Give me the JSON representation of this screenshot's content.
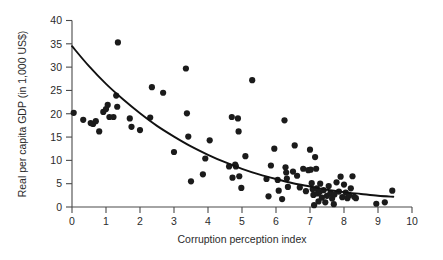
{
  "chart_data": {
    "type": "scatter",
    "title": "",
    "xlabel": "Corruption perception index",
    "ylabel": "Real per capita GDP (in 1,000 US$)",
    "xlim": [
      0,
      10
    ],
    "ylim": [
      0,
      40
    ],
    "xticks": [
      0,
      1,
      2,
      3,
      4,
      5,
      6,
      7,
      8,
      9,
      10
    ],
    "yticks": [
      0,
      5,
      10,
      15,
      20,
      25,
      30,
      35,
      40
    ],
    "xticklabels": [
      "0",
      "1",
      "2",
      "3",
      "4",
      "5",
      "6",
      "7",
      "8",
      "9",
      "10"
    ],
    "yticklabels": [
      "0",
      "5",
      "10",
      "15",
      "20",
      "25",
      "30",
      "35",
      "40"
    ],
    "grid": false,
    "legend": null,
    "marker": {
      "shape": "circle",
      "color": "#1b1b1b",
      "size_px": 4.0
    },
    "points": [
      [
        0.05,
        20.2
      ],
      [
        0.33,
        18.7
      ],
      [
        0.55,
        18.0
      ],
      [
        0.62,
        17.8
      ],
      [
        0.7,
        18.4
      ],
      [
        0.8,
        16.2
      ],
      [
        0.92,
        20.4
      ],
      [
        1.0,
        21.0
      ],
      [
        1.05,
        21.9
      ],
      [
        1.1,
        19.3
      ],
      [
        1.22,
        19.3
      ],
      [
        1.3,
        23.9
      ],
      [
        1.33,
        21.5
      ],
      [
        1.35,
        35.3
      ],
      [
        1.7,
        19.0
      ],
      [
        1.75,
        17.2
      ],
      [
        2.0,
        16.5
      ],
      [
        2.3,
        19.2
      ],
      [
        2.35,
        25.7
      ],
      [
        2.68,
        24.5
      ],
      [
        3.0,
        11.8
      ],
      [
        3.35,
        29.7
      ],
      [
        3.38,
        20.1
      ],
      [
        3.42,
        15.1
      ],
      [
        3.5,
        5.5
      ],
      [
        3.85,
        7.0
      ],
      [
        3.92,
        10.4
      ],
      [
        4.05,
        14.3
      ],
      [
        4.62,
        8.7
      ],
      [
        4.7,
        19.3
      ],
      [
        4.72,
        6.3
      ],
      [
        4.8,
        9.1
      ],
      [
        4.82,
        8.7
      ],
      [
        4.88,
        19.0
      ],
      [
        4.9,
        16.2
      ],
      [
        4.92,
        6.6
      ],
      [
        4.98,
        4.1
      ],
      [
        5.1,
        10.9
      ],
      [
        5.3,
        27.2
      ],
      [
        5.72,
        6.0
      ],
      [
        5.78,
        2.3
      ],
      [
        5.85,
        8.9
      ],
      [
        5.95,
        12.5
      ],
      [
        6.05,
        5.8
      ],
      [
        6.08,
        3.5
      ],
      [
        6.18,
        1.7
      ],
      [
        6.25,
        18.6
      ],
      [
        6.28,
        8.5
      ],
      [
        6.3,
        7.4
      ],
      [
        6.32,
        6.1
      ],
      [
        6.35,
        4.3
      ],
      [
        6.5,
        7.6
      ],
      [
        6.55,
        13.2
      ],
      [
        6.62,
        6.7
      ],
      [
        6.7,
        4.2
      ],
      [
        6.8,
        8.2
      ],
      [
        6.88,
        3.4
      ],
      [
        6.95,
        7.9
      ],
      [
        7.0,
        12.3
      ],
      [
        7.02,
        8.0
      ],
      [
        7.05,
        5.1
      ],
      [
        7.08,
        3.8
      ],
      [
        7.1,
        2.6
      ],
      [
        7.12,
        0.4
      ],
      [
        7.15,
        10.7
      ],
      [
        7.18,
        8.2
      ],
      [
        7.2,
        4.0
      ],
      [
        7.22,
        2.9
      ],
      [
        7.25,
        1.2
      ],
      [
        7.28,
        3.2
      ],
      [
        7.3,
        5.0
      ],
      [
        7.35,
        2.0
      ],
      [
        7.4,
        3.6
      ],
      [
        7.45,
        1.0
      ],
      [
        7.5,
        2.4
      ],
      [
        7.55,
        4.5
      ],
      [
        7.6,
        3.0
      ],
      [
        7.65,
        1.8
      ],
      [
        7.7,
        0.6
      ],
      [
        7.72,
        2.7
      ],
      [
        7.78,
        5.3
      ],
      [
        7.85,
        3.3
      ],
      [
        7.9,
        6.5
      ],
      [
        7.95,
        2.1
      ],
      [
        8.0,
        4.8
      ],
      [
        8.05,
        3.1
      ],
      [
        8.1,
        1.9
      ],
      [
        8.15,
        2.5
      ],
      [
        8.2,
        4.0
      ],
      [
        8.25,
        6.6
      ],
      [
        8.3,
        2.2
      ],
      [
        8.35,
        1.9
      ],
      [
        8.95,
        0.7
      ],
      [
        9.2,
        1.0
      ],
      [
        9.42,
        3.5
      ]
    ],
    "fit_curve": {
      "label": "exponential trend",
      "color": "#111111",
      "x_start": 0.0,
      "x_end": 9.45,
      "y_start": 34.5,
      "y_end": 2.2,
      "samples": [
        [
          0.0,
          34.5
        ],
        [
          0.5,
          30.2
        ],
        [
          1.0,
          26.4
        ],
        [
          1.5,
          23.1
        ],
        [
          2.0,
          20.1
        ],
        [
          2.5,
          17.4
        ],
        [
          3.0,
          15.1
        ],
        [
          3.5,
          13.0
        ],
        [
          4.0,
          11.2
        ],
        [
          4.5,
          9.6
        ],
        [
          5.0,
          8.2
        ],
        [
          5.5,
          7.0
        ],
        [
          6.0,
          6.0
        ],
        [
          6.5,
          5.1
        ],
        [
          7.0,
          4.4
        ],
        [
          7.5,
          3.7
        ],
        [
          8.0,
          3.2
        ],
        [
          8.5,
          2.8
        ],
        [
          9.0,
          2.4
        ],
        [
          9.45,
          2.2
        ]
      ]
    }
  },
  "axes": {
    "x_title": "Corruption perception index",
    "y_title": "Real per capita GDP (in 1,000 US$)"
  }
}
